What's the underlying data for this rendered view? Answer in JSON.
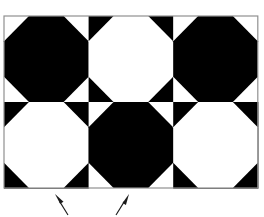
{
  "figure": {
    "type": "geometric-pattern",
    "canvas": {
      "width": 264,
      "height": 217,
      "background": "#ffffff"
    },
    "colors": {
      "black": "#000000",
      "white": "#ffffff",
      "border": "#909090",
      "arrow": "#1a1a1a"
    },
    "pattern": {
      "description": "3 columns by 2 rows of square tiles; each tile holds an octagon with four corner triangles; tiles alternate in a checkerboard of inverted colors",
      "columns": 3,
      "rows": 2,
      "tile_width": 84.6,
      "tile_height": 86,
      "origin_x": 4,
      "origin_y": 16,
      "corner_ratio": 0.295,
      "tiles": [
        {
          "row": 0,
          "col": 0,
          "octagon_fill": "#000000",
          "background_fill": "#ffffff",
          "name": "tile-r0-c0"
        },
        {
          "row": 0,
          "col": 1,
          "octagon_fill": "#ffffff",
          "background_fill": "#000000",
          "name": "tile-r0-c1"
        },
        {
          "row": 0,
          "col": 2,
          "octagon_fill": "#000000",
          "background_fill": "#ffffff",
          "name": "tile-r0-c2"
        },
        {
          "row": 1,
          "col": 0,
          "octagon_fill": "#ffffff",
          "background_fill": "#000000",
          "name": "tile-r1-c0"
        },
        {
          "row": 1,
          "col": 1,
          "octagon_fill": "#000000",
          "background_fill": "#ffffff",
          "name": "tile-r1-c1"
        },
        {
          "row": 1,
          "col": 2,
          "octagon_fill": "#ffffff",
          "background_fill": "#000000",
          "name": "tile-r1-c2"
        }
      ]
    },
    "border": {
      "color": "#909090",
      "width": 1.2,
      "x": 4,
      "y": 16,
      "w": 253.8,
      "h": 172
    },
    "annotations": {
      "arrows": [
        {
          "name": "annotation-arrow-left",
          "tail_x": 68,
          "tail_y": 215,
          "head_x": 55,
          "head_y": 194,
          "color": "#1a1a1a"
        },
        {
          "name": "annotation-arrow-right",
          "tail_x": 116,
          "tail_y": 215,
          "head_x": 129,
          "head_y": 194,
          "color": "#1a1a1a"
        }
      ]
    }
  }
}
